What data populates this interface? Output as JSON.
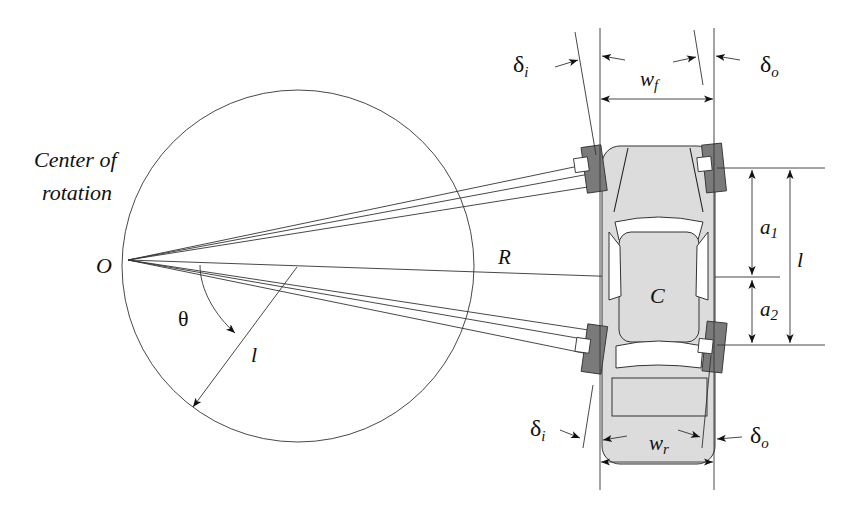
{
  "diagram": {
    "title_label": {
      "line1": "Center of",
      "line2": "rotation"
    },
    "labels": {
      "origin": "O",
      "radius": "R",
      "angle": "θ",
      "circle_radius": "l",
      "center_mass": "C",
      "wheelbase": "l",
      "a1_base": "a",
      "a1_sub": "1",
      "a2_base": "a",
      "a2_sub": "2",
      "wf_base": "w",
      "wf_sub": "f",
      "wr_base": "w",
      "wr_sub": "r",
      "delta_i_top_base": "δ",
      "delta_i_top_sub": "i",
      "delta_o_top_base": "δ",
      "delta_o_top_sub": "o",
      "delta_i_bottom_base": "δ",
      "delta_i_bottom_sub": "i",
      "delta_o_bottom_base": "δ",
      "delta_o_bottom_sub": "o"
    },
    "colors": {
      "line": "#222222",
      "car_body": "#dcdcdc",
      "tire": "#7a7a7a",
      "background": "#ffffff"
    }
  }
}
